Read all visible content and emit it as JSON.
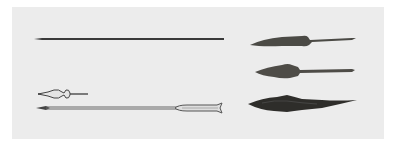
{
  "image": {
    "subject": "archaeological arrowheads and arrows",
    "background_color": "#ededed",
    "frame_color": "#ffffff",
    "objects": [
      {
        "name": "long-arrow-shaft",
        "color": "#3a3a3a"
      },
      {
        "name": "small-arrow-with-bulbous-head",
        "color": "#4a4a4a"
      },
      {
        "name": "arrow-with-fletching",
        "color": "#555555"
      },
      {
        "name": "iron-arrowhead-top",
        "color": "#4b4a45"
      },
      {
        "name": "iron-arrowhead-middle",
        "color": "#4e4c47"
      },
      {
        "name": "iron-arrowhead-bottom-corroded",
        "color": "#2e2d2a"
      }
    ]
  }
}
